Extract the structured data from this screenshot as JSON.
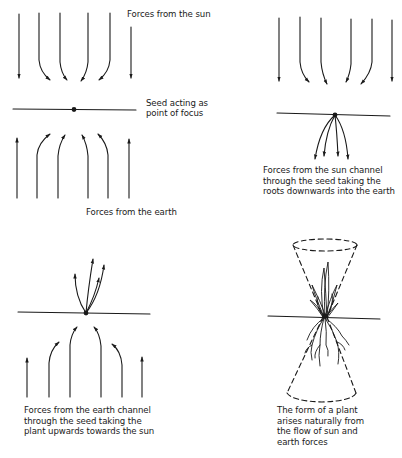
{
  "panels": [
    {
      "id": "panel-1",
      "labels": {
        "sun": "Forces from the sun",
        "seed_line1": "Seed acting as",
        "seed_line2": "point of focus",
        "earth": "Forces from the earth"
      }
    },
    {
      "id": "panel-2",
      "caption": [
        "Forces from the sun channel",
        "through the seed taking the",
        "roots downwards into the earth"
      ]
    },
    {
      "id": "panel-3",
      "caption": [
        "Forces from the earth channel",
        "through the seed taking the",
        "plant upwards towards the sun"
      ]
    },
    {
      "id": "panel-4",
      "caption": [
        "The form of a plant",
        "arises naturally from",
        "the flow of sun and",
        "earth forces"
      ]
    }
  ],
  "colors": {
    "ink": "#1a1a1a",
    "background": "#ffffff"
  }
}
